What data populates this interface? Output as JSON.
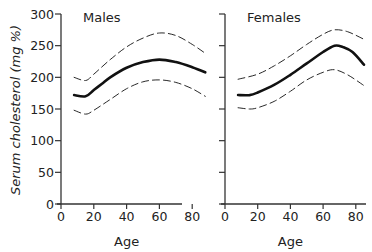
{
  "chart_data": {
    "type": "line",
    "ylabel": "Serum cholesterol (mg %)",
    "ylim": [
      0,
      300
    ],
    "yticks": [
      0,
      50,
      100,
      150,
      200,
      250,
      300
    ],
    "panels": [
      {
        "title": "Males",
        "xlabel": "Age",
        "xlim": [
          0,
          90
        ],
        "xticks": [
          0,
          20,
          40,
          60,
          80
        ],
        "show_yticklabels": true,
        "series": [
          {
            "name": "mean",
            "style": "solid",
            "x": [
              8,
              15,
              20,
              25,
              30,
              40,
              50,
              60,
              70,
              80,
              88
            ],
            "y": [
              172,
              170,
              180,
              190,
              200,
              215,
              224,
              228,
              224,
              216,
              208
            ]
          },
          {
            "name": "upper",
            "style": "dashed",
            "x": [
              8,
              15,
              20,
              30,
              40,
              50,
              60,
              70,
              80,
              88
            ],
            "y": [
              200,
              195,
              205,
              228,
              248,
              262,
              270,
              266,
              252,
              238
            ]
          },
          {
            "name": "lower",
            "style": "dashed",
            "x": [
              8,
              15,
              20,
              30,
              40,
              50,
              60,
              70,
              80,
              88
            ],
            "y": [
              148,
              142,
              148,
              165,
              182,
              193,
              196,
              192,
              182,
              170
            ]
          }
        ]
      },
      {
        "title": "Females",
        "xlabel": "Age",
        "xlim": [
          0,
          90
        ],
        "xticks": [
          0,
          20,
          40,
          60,
          80
        ],
        "show_yticklabels": false,
        "series": [
          {
            "name": "mean",
            "style": "solid",
            "x": [
              8,
              15,
              20,
              30,
              40,
              50,
              60,
              67,
              72,
              78,
              85
            ],
            "y": [
              172,
              172,
              176,
              188,
              204,
              222,
              240,
              250,
              248,
              240,
              220
            ]
          },
          {
            "name": "upper",
            "style": "dashed",
            "x": [
              8,
              20,
              30,
              40,
              50,
              60,
              67,
              75,
              85
            ],
            "y": [
              197,
              205,
              218,
              234,
              252,
              268,
              275,
              272,
              260
            ]
          },
          {
            "name": "lower",
            "style": "dashed",
            "x": [
              8,
              15,
              20,
              30,
              40,
              50,
              60,
              67,
              75,
              85
            ],
            "y": [
              152,
              150,
              152,
              162,
              178,
              196,
              208,
              212,
              204,
              187
            ]
          }
        ]
      }
    ]
  }
}
